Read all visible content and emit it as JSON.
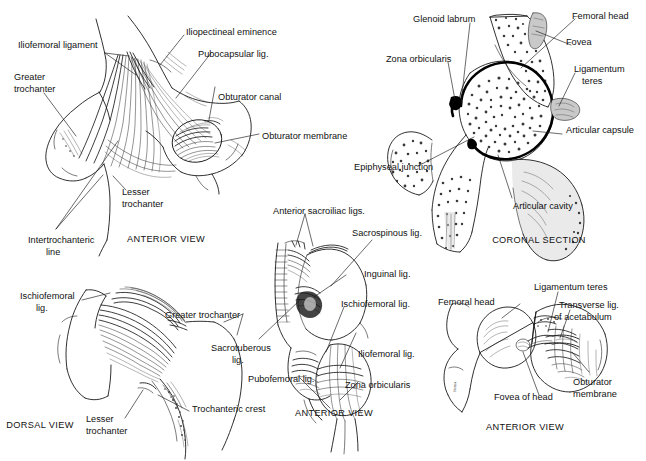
{
  "plate": {
    "title": "Hip joint ligaments and coronal section anatomical plate",
    "background_color": "#ffffff",
    "ink_color": "#111111"
  },
  "panels": [
    {
      "id": "anterior-hip-ligaments",
      "view_caption": "ANTERIOR VIEW",
      "labels": [
        {
          "id": "iliofemoral-ligament",
          "text": "Iliofemoral ligament"
        },
        {
          "id": "greater-trochanter",
          "text": "Greater"
        },
        {
          "id": "greater-trochanter-2",
          "text": "trochanter"
        },
        {
          "id": "iliopectineal-eminence",
          "text": "Iliopectineal eminence"
        },
        {
          "id": "pubocapsular-lig",
          "text": "Pubocapsular lig."
        },
        {
          "id": "obturator-canal",
          "text": "Obturator canal"
        },
        {
          "id": "obturator-membrane",
          "text": "Obturator membrane"
        },
        {
          "id": "lesser-trochanter",
          "text": "Lesser"
        },
        {
          "id": "lesser-trochanter-2",
          "text": "trochanter"
        },
        {
          "id": "intertrochanteric-line",
          "text": "Intertrochanteric"
        },
        {
          "id": "intertrochanteric-line-2",
          "text": "line"
        }
      ]
    },
    {
      "id": "coronal-section",
      "view_caption": "CORONAL SECTION",
      "labels": [
        {
          "id": "glenoid-labrum",
          "text": "Glenoid labrum"
        },
        {
          "id": "femoral-head",
          "text": "Femoral head"
        },
        {
          "id": "fovea",
          "text": "Fovea"
        },
        {
          "id": "zona-orbicularis",
          "text": "Zona orbicularis"
        },
        {
          "id": "ligamentum-teres",
          "text": "Ligamentum"
        },
        {
          "id": "ligamentum-teres-2",
          "text": "teres"
        },
        {
          "id": "articular-capsule",
          "text": "Articular capsule"
        },
        {
          "id": "epiphyseal-junction",
          "text": "Epiphyseal junction"
        },
        {
          "id": "articular-cavity",
          "text": "Articular cavity"
        }
      ]
    },
    {
      "id": "dorsal-hip-ligaments",
      "view_caption": "DORSAL VIEW",
      "labels": [
        {
          "id": "ischiofemoral-lig",
          "text": "Ischiofemoral"
        },
        {
          "id": "ischiofemoral-lig-2",
          "text": "lig."
        },
        {
          "id": "greater-trochanter",
          "text": "Greater trochanter"
        },
        {
          "id": "lesser-trochanter",
          "text": "Lesser"
        },
        {
          "id": "lesser-trochanter-2",
          "text": "trochanter"
        },
        {
          "id": "trochanteric-crest",
          "text": "Trochanteric crest"
        }
      ]
    },
    {
      "id": "anterior-pelvis-ligaments",
      "view_caption": "ANTERIOR VIEW",
      "labels": [
        {
          "id": "anterior-sacroiliac-ligs",
          "text": "Anterior sacroiliac ligs."
        },
        {
          "id": "sacrospinous-lig",
          "text": "Sacrospinous lig."
        },
        {
          "id": "inguinal-lig",
          "text": "Inguinal lig."
        },
        {
          "id": "ischiofemoral-lig",
          "text": "Ischiofemoral lig."
        },
        {
          "id": "iliofemoral-lig",
          "text": "Iliofemoral lig."
        },
        {
          "id": "sacrotuberous-lig",
          "text": "Sacrotuberous"
        },
        {
          "id": "sacrotuberous-lig-2",
          "text": "lig."
        },
        {
          "id": "pubofemoral-lig",
          "text": "Pubofemoral lig."
        },
        {
          "id": "zona-orbicularis",
          "text": "Zona orbicularis"
        }
      ]
    },
    {
      "id": "acetabulum-open",
      "view_caption": "ANTERIOR VIEW",
      "labels": [
        {
          "id": "ligamentum-teres",
          "text": "Ligamentum teres"
        },
        {
          "id": "transverse-lig",
          "text": "Transverse lig."
        },
        {
          "id": "transverse-lig-2",
          "text": "of acetabulum"
        },
        {
          "id": "femoral-head",
          "text": "Femoral head"
        },
        {
          "id": "fovea-of-head",
          "text": "Fovea of head"
        },
        {
          "id": "obturator-membrane",
          "text": "Obturator"
        },
        {
          "id": "obturator-membrane-2",
          "text": "membrane"
        }
      ]
    }
  ]
}
